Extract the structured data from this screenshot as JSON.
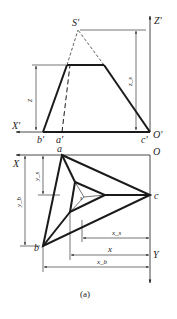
{
  "figure": {
    "caption": "(a)",
    "front_view": {
      "apex_label": "S'",
      "axis_z_label": "Z'",
      "axis_x_label": "X'",
      "origin_label": "O'",
      "base_labels": {
        "b": "b'",
        "a": "a'",
        "c": "c'"
      },
      "dim_z_label": "z",
      "dim_zs_label": "z_s"
    },
    "top_view": {
      "origin_label": "O",
      "axis_x_label": "X",
      "axis_y_label": "Y",
      "vertex_labels": {
        "a": "a",
        "b": "b",
        "c": "c"
      },
      "inner_label": "s",
      "dim_ys_label": "y_s",
      "dim_yb_label": "y_b",
      "dim_xs_label": "x_s",
      "dim_x_label": "x",
      "dim_xb_label": "x_b"
    },
    "colors": {
      "line": "#1a1a1a",
      "background": "#ffffff"
    }
  }
}
